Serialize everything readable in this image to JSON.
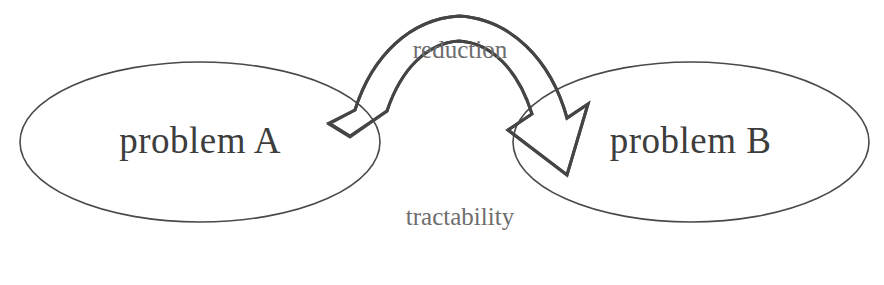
{
  "diagram": {
    "type": "cycle-diagram",
    "background_color": "#ffffff",
    "stroke_color": "#454545",
    "ellipse_stroke_color": "#4a4a4a",
    "node_text_color": "#3d3d3d",
    "edge_text_color": "#6d6d6d",
    "nodes": [
      {
        "id": "problem-a",
        "label": "problem A",
        "shape": "ellipse",
        "cx": 200,
        "cy": 142,
        "rx": 180,
        "ry": 80
      },
      {
        "id": "problem-b",
        "label": "problem B",
        "shape": "ellipse",
        "cx": 691,
        "cy": 142,
        "rx": 178,
        "ry": 80
      }
    ],
    "edges": [
      {
        "id": "reduction",
        "label": "reduction",
        "from": "problem-a",
        "to": "problem-b",
        "direction": "left-to-right",
        "position": "top",
        "arrowhead": "open-triangle"
      },
      {
        "id": "tractability",
        "label": "tractability",
        "from": "problem-b",
        "to": "problem-a",
        "direction": "right-to-left",
        "position": "bottom",
        "arrowhead": "open-triangle"
      }
    ]
  }
}
